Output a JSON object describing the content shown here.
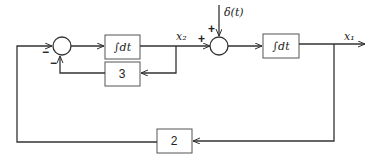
{
  "diagram": {
    "type": "block-diagram",
    "blocks": [
      {
        "id": "integrator-1",
        "label": "∫dt"
      },
      {
        "id": "gain-3",
        "label": "3"
      },
      {
        "id": "integrator-2",
        "label": "∫dt"
      },
      {
        "id": "gain-2",
        "label": "2"
      }
    ],
    "summing_junctions": [
      {
        "id": "sum-1",
        "signs": [
          "−",
          "−"
        ]
      },
      {
        "id": "sum-2",
        "signs": [
          "+",
          "+"
        ]
      }
    ],
    "signals": {
      "x2": "x₂",
      "x1": "x₁",
      "input": "δ(t)"
    },
    "signs": {
      "sum1_left": "−",
      "sum1_bottom": "−",
      "sum2_left": "+",
      "sum2_top": "+"
    }
  }
}
